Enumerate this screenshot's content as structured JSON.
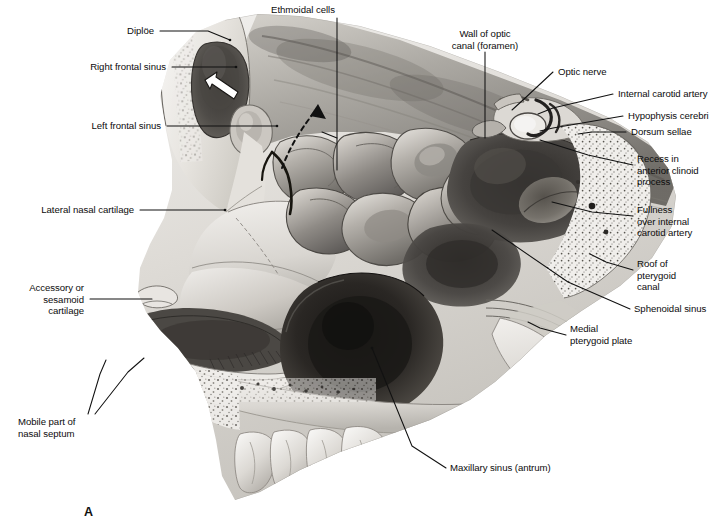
{
  "figure": {
    "panel_letter": "A",
    "type": "anatomical-illustration",
    "render": "grayscale medical illustration / halftone drawing",
    "background_color": "#ffffff",
    "ink_color": "#0c0c0c"
  },
  "labels": [
    {
      "id": "diploe",
      "text": "Diplöe",
      "align": "right",
      "x": 154,
      "y": 25,
      "leader": [
        [
          160,
          31
        ],
        [
          208,
          31
        ],
        [
          230,
          40
        ]
      ]
    },
    {
      "id": "right-frontal-sinus",
      "text": "Right frontal sinus",
      "align": "right",
      "x": 166,
      "y": 61,
      "leader": [
        [
          172,
          67
        ],
        [
          236,
          67
        ]
      ]
    },
    {
      "id": "left-frontal-sinus",
      "text": "Left frontal sinus",
      "align": "right",
      "x": 161,
      "y": 120,
      "leader": [
        [
          167,
          126
        ],
        [
          277,
          126
        ]
      ]
    },
    {
      "id": "lateral-nasal-cartilage",
      "text": "Lateral nasal cartilage",
      "align": "right",
      "x": 134,
      "y": 204,
      "leader": [
        [
          140,
          210
        ],
        [
          225,
          210
        ]
      ]
    },
    {
      "id": "accessory-or-sesamoid-cartilage",
      "text": "Accessory or\nsesamoid\ncartilage",
      "align": "right",
      "x": 84,
      "y": 282,
      "leader": [
        [
          90,
          299
        ],
        [
          152,
          299
        ]
      ]
    },
    {
      "id": "mobile-part-of-nasal-septum",
      "text": "Mobile part of\nnasal septum",
      "align": "left",
      "x": 18,
      "y": 416,
      "leader": [
        [
          88,
          414
        ],
        [
          100,
          374
        ],
        [
          106,
          360
        ]
      ],
      "leader2": [
        [
          95,
          414
        ],
        [
          128,
          372
        ],
        [
          144,
          358
        ]
      ]
    },
    {
      "id": "ethmoidal-cells",
      "text": "Ethmoidal cells",
      "align": "center",
      "x": 303,
      "y": 4,
      "leader": [
        [
          337,
          18
        ],
        [
          337,
          170
        ]
      ],
      "leader2": [
        [
          337,
          18
        ],
        [
          337,
          120
        ],
        [
          318,
          133
        ]
      ]
    },
    {
      "id": "wall-of-optic-canal",
      "text": "Wall of optic\ncanal (foramen)",
      "align": "center",
      "x": 437,
      "y": 28,
      "leader": [
        [
          485,
          52
        ],
        [
          485,
          138
        ]
      ]
    },
    {
      "id": "optic-nerve",
      "text": "Optic nerve",
      "align": "left",
      "x": 558,
      "y": 66,
      "leader": [
        [
          553,
          72
        ],
        [
          523,
          100
        ],
        [
          512,
          110
        ]
      ]
    },
    {
      "id": "internal-carotid-artery",
      "text": "Internal carotid artery",
      "align": "left",
      "x": 618,
      "y": 88,
      "leader": [
        [
          613,
          94
        ],
        [
          553,
          108
        ],
        [
          538,
          114
        ]
      ]
    },
    {
      "id": "hypophysis-cerebri",
      "text": "Hypophysis cerebri",
      "align": "left",
      "x": 628,
      "y": 110,
      "leader": [
        [
          623,
          116
        ],
        [
          553,
          128
        ],
        [
          540,
          131
        ]
      ]
    },
    {
      "id": "dorsum-sellae",
      "text": "Dorsum sellae",
      "align": "left",
      "x": 631,
      "y": 126,
      "leader": [
        [
          626,
          132
        ],
        [
          592,
          132
        ],
        [
          578,
          134
        ]
      ]
    },
    {
      "id": "recess-in-anterior-clinoid-process",
      "text": "Recess in\nanterior clinoid\nprocess",
      "align": "left",
      "x": 637,
      "y": 153,
      "leader": [
        [
          633,
          165
        ],
        [
          588,
          155
        ],
        [
          540,
          140
        ]
      ]
    },
    {
      "id": "fullness-over-internal-carotid-artery",
      "text": "Fullness\nover internal\ncarotid artery",
      "align": "left",
      "x": 637,
      "y": 204,
      "leader": [
        [
          633,
          216
        ],
        [
          592,
          212
        ],
        [
          552,
          202
        ]
      ]
    },
    {
      "id": "roof-of-pterygoid-canal",
      "text": "Roof of\npterygoid\ncanal",
      "align": "left",
      "x": 637,
      "y": 258,
      "leader": [
        [
          633,
          270
        ],
        [
          606,
          262
        ],
        [
          590,
          254
        ]
      ]
    },
    {
      "id": "sphenoidal-sinus",
      "text": "Sphenoidal sinus",
      "align": "left",
      "x": 634,
      "y": 303,
      "leader": [
        [
          630,
          309
        ],
        [
          568,
          282
        ],
        [
          492,
          230
        ]
      ]
    },
    {
      "id": "medial-pterygoid-plate",
      "text": "Medial\npterygoid plate",
      "align": "left",
      "x": 570,
      "y": 323,
      "leader": [
        [
          566,
          335
        ],
        [
          540,
          328
        ],
        [
          528,
          322
        ]
      ]
    },
    {
      "id": "maxillary-sinus-antrum",
      "text": "Maxillary sinus (antrum)",
      "align": "left",
      "x": 450,
      "y": 462,
      "leader": [
        [
          446,
          468
        ],
        [
          412,
          446
        ],
        [
          372,
          348
        ]
      ]
    }
  ]
}
